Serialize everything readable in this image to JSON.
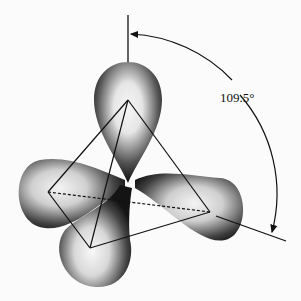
{
  "diagram": {
    "type": "sp3 hybrid orbitals (tetrahedral)",
    "angle_label": "109.5°",
    "colors": {
      "background": "#fbfbfb",
      "line": "#111111",
      "lobe_dark": "#1a1a1a",
      "lobe_light": "#f2f2f2"
    },
    "lobes": [
      {
        "name": "top",
        "tip": [
          128,
          100
        ]
      },
      {
        "name": "left",
        "tip": [
          48,
          192
        ]
      },
      {
        "name": "bottom-left",
        "tip": [
          90,
          248
        ]
      },
      {
        "name": "right",
        "tip": [
          210,
          212
        ]
      }
    ],
    "center": [
      128,
      183
    ]
  }
}
